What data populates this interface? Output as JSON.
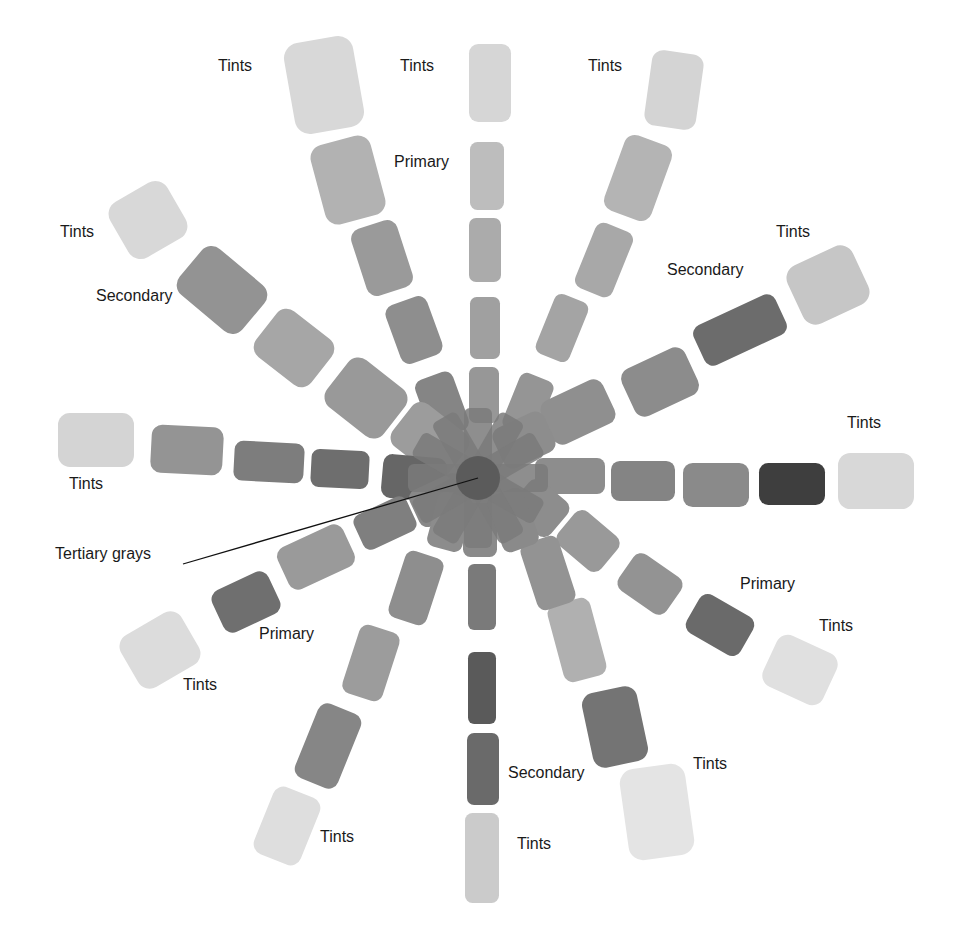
{
  "figure": {
    "center": [
      478,
      478
    ],
    "pointer": {
      "label": "Tertiary grays",
      "from": [
        183,
        564
      ],
      "to": [
        478,
        478
      ]
    },
    "labels": [
      {
        "text": "Tints",
        "x": 218,
        "y": 66
      },
      {
        "text": "Tints",
        "x": 400,
        "y": 66
      },
      {
        "text": "Tints",
        "x": 588,
        "y": 66
      },
      {
        "text": "Primary",
        "x": 394,
        "y": 162
      },
      {
        "text": "Tints",
        "x": 60,
        "y": 232
      },
      {
        "text": "Secondary",
        "x": 96,
        "y": 296
      },
      {
        "text": "Tints",
        "x": 776,
        "y": 232
      },
      {
        "text": "Secondary",
        "x": 667,
        "y": 270
      },
      {
        "text": "Tints",
        "x": 847,
        "y": 423
      },
      {
        "text": "Tints",
        "x": 69,
        "y": 484
      },
      {
        "text": "Tertiary grays",
        "x": 55,
        "y": 554
      },
      {
        "text": "Primary",
        "x": 740,
        "y": 584
      },
      {
        "text": "Tints",
        "x": 819,
        "y": 626
      },
      {
        "text": "Primary",
        "x": 259,
        "y": 634
      },
      {
        "text": "Tints",
        "x": 183,
        "y": 685
      },
      {
        "text": "Tints",
        "x": 693,
        "y": 764
      },
      {
        "text": "Secondary",
        "x": 508,
        "y": 773
      },
      {
        "text": "Tints",
        "x": 320,
        "y": 837
      },
      {
        "text": "Tints",
        "x": 517,
        "y": 844
      }
    ],
    "spokes": [
      {
        "name": "top-left-upper",
        "swatches": [
          {
            "x": 324,
            "y": 85,
            "w": 70,
            "h": 92,
            "a": -10,
            "c": "#d8d8d8"
          },
          {
            "x": 348,
            "y": 180,
            "w": 62,
            "h": 82,
            "a": -15,
            "c": "#b2b2b2"
          },
          {
            "x": 382,
            "y": 258,
            "w": 48,
            "h": 70,
            "a": -18,
            "c": "#9a9a9a"
          },
          {
            "x": 414,
            "y": 330,
            "w": 44,
            "h": 62,
            "a": -20,
            "c": "#8e8e8e"
          },
          {
            "x": 442,
            "y": 405,
            "w": 40,
            "h": 62,
            "a": -20,
            "c": "#858585"
          }
        ]
      },
      {
        "name": "top",
        "swatches": [
          {
            "x": 490,
            "y": 83,
            "w": 42,
            "h": 78,
            "a": 0,
            "c": "#d6d6d6"
          },
          {
            "x": 487,
            "y": 176,
            "w": 34,
            "h": 68,
            "a": 0,
            "c": "#bdbdbd"
          },
          {
            "x": 485,
            "y": 250,
            "w": 32,
            "h": 64,
            "a": 0,
            "c": "#ababab"
          },
          {
            "x": 485,
            "y": 328,
            "w": 30,
            "h": 62,
            "a": 0,
            "c": "#a0a0a0"
          },
          {
            "x": 484,
            "y": 395,
            "w": 30,
            "h": 56,
            "a": 0,
            "c": "#979797"
          }
        ]
      },
      {
        "name": "top-right-upper",
        "swatches": [
          {
            "x": 674,
            "y": 90,
            "w": 52,
            "h": 76,
            "a": 8,
            "c": "#d4d4d4"
          },
          {
            "x": 638,
            "y": 178,
            "w": 50,
            "h": 80,
            "a": 20,
            "c": "#b4b4b4"
          },
          {
            "x": 604,
            "y": 260,
            "w": 40,
            "h": 70,
            "a": 22,
            "c": "#a8a8a8"
          },
          {
            "x": 562,
            "y": 328,
            "w": 36,
            "h": 64,
            "a": 22,
            "c": "#a4a4a4"
          },
          {
            "x": 528,
            "y": 405,
            "w": 36,
            "h": 60,
            "a": 22,
            "c": "#959595"
          }
        ]
      },
      {
        "name": "upper-left",
        "swatches": [
          {
            "x": 148,
            "y": 220,
            "w": 66,
            "h": 64,
            "a": -30,
            "c": "#d8d8d8"
          },
          {
            "x": 222,
            "y": 290,
            "w": 82,
            "h": 60,
            "a": 40,
            "c": "#939393"
          },
          {
            "x": 294,
            "y": 348,
            "w": 70,
            "h": 58,
            "a": 38,
            "c": "#a6a6a6"
          },
          {
            "x": 366,
            "y": 398,
            "w": 72,
            "h": 60,
            "a": 38,
            "c": "#999999"
          },
          {
            "x": 430,
            "y": 440,
            "w": 70,
            "h": 54,
            "a": 38,
            "c": "#9c9c9c"
          }
        ]
      },
      {
        "name": "upper-right",
        "swatches": [
          {
            "x": 828,
            "y": 285,
            "w": 72,
            "h": 64,
            "a": -25,
            "c": "#c6c6c6"
          },
          {
            "x": 740,
            "y": 330,
            "w": 90,
            "h": 44,
            "a": -25,
            "c": "#6c6c6c"
          },
          {
            "x": 660,
            "y": 382,
            "w": 70,
            "h": 52,
            "a": -25,
            "c": "#8c8c8c"
          },
          {
            "x": 578,
            "y": 412,
            "w": 68,
            "h": 48,
            "a": -25,
            "c": "#8f8f8f"
          },
          {
            "x": 524,
            "y": 440,
            "w": 56,
            "h": 44,
            "a": -25,
            "c": "#8d8d8d"
          }
        ]
      },
      {
        "name": "left",
        "swatches": [
          {
            "x": 96,
            "y": 440,
            "w": 76,
            "h": 54,
            "a": 0,
            "c": "#d4d4d4"
          },
          {
            "x": 187,
            "y": 450,
            "w": 72,
            "h": 48,
            "a": 3,
            "c": "#949494"
          },
          {
            "x": 269,
            "y": 462,
            "w": 70,
            "h": 40,
            "a": 3,
            "c": "#7d7d7d"
          },
          {
            "x": 340,
            "y": 469,
            "w": 58,
            "h": 38,
            "a": 3,
            "c": "#6e6e6e"
          },
          {
            "x": 414,
            "y": 478,
            "w": 64,
            "h": 44,
            "a": 5,
            "c": "#666666"
          }
        ]
      },
      {
        "name": "right",
        "swatches": [
          {
            "x": 876,
            "y": 481,
            "w": 76,
            "h": 56,
            "a": 0,
            "c": "#d8d8d8"
          },
          {
            "x": 792,
            "y": 484,
            "w": 66,
            "h": 42,
            "a": 0,
            "c": "#3e3e3e"
          },
          {
            "x": 716,
            "y": 485,
            "w": 66,
            "h": 44,
            "a": 0,
            "c": "#8a8a8a"
          },
          {
            "x": 643,
            "y": 481,
            "w": 64,
            "h": 40,
            "a": 0,
            "c": "#848484"
          },
          {
            "x": 570,
            "y": 476,
            "w": 70,
            "h": 36,
            "a": 0,
            "c": "#8d8d8d"
          }
        ]
      },
      {
        "name": "lower-left",
        "swatches": [
          {
            "x": 160,
            "y": 650,
            "w": 70,
            "h": 60,
            "a": -30,
            "c": "#dcdcdc"
          },
          {
            "x": 246,
            "y": 602,
            "w": 62,
            "h": 46,
            "a": -25,
            "c": "#6f6f6f"
          },
          {
            "x": 316,
            "y": 557,
            "w": 72,
            "h": 46,
            "a": -25,
            "c": "#9a9a9a"
          },
          {
            "x": 385,
            "y": 523,
            "w": 58,
            "h": 38,
            "a": -25,
            "c": "#7f7f7f"
          },
          {
            "x": 440,
            "y": 500,
            "w": 56,
            "h": 40,
            "a": -25,
            "c": "#888888"
          }
        ]
      },
      {
        "name": "lower-right",
        "swatches": [
          {
            "x": 800,
            "y": 670,
            "w": 66,
            "h": 56,
            "a": 25,
            "c": "#e0e0e0"
          },
          {
            "x": 720,
            "y": 625,
            "w": 62,
            "h": 44,
            "a": 30,
            "c": "#6a6a6a"
          },
          {
            "x": 650,
            "y": 584,
            "w": 58,
            "h": 44,
            "a": 35,
            "c": "#939393"
          },
          {
            "x": 588,
            "y": 541,
            "w": 56,
            "h": 44,
            "a": 40,
            "c": "#999999"
          },
          {
            "x": 540,
            "y": 508,
            "w": 50,
            "h": 44,
            "a": 40,
            "c": "#8d8d8d"
          }
        ]
      },
      {
        "name": "bottom-left",
        "swatches": [
          {
            "x": 287,
            "y": 826,
            "w": 50,
            "h": 72,
            "a": 22,
            "c": "#dedede"
          },
          {
            "x": 328,
            "y": 746,
            "w": 46,
            "h": 80,
            "a": 22,
            "c": "#868686"
          },
          {
            "x": 371,
            "y": 663,
            "w": 42,
            "h": 72,
            "a": 18,
            "c": "#9c9c9c"
          },
          {
            "x": 416,
            "y": 588,
            "w": 40,
            "h": 70,
            "a": 18,
            "c": "#8e8e8e"
          },
          {
            "x": 450,
            "y": 522,
            "w": 36,
            "h": 56,
            "a": 15,
            "c": "#8c8c8c"
          }
        ]
      },
      {
        "name": "bottom",
        "swatches": [
          {
            "x": 482,
            "y": 858,
            "w": 34,
            "h": 90,
            "a": 0,
            "c": "#cbcbcb"
          },
          {
            "x": 483,
            "y": 769,
            "w": 32,
            "h": 72,
            "a": 0,
            "c": "#6a6a6a"
          },
          {
            "x": 482,
            "y": 688,
            "w": 28,
            "h": 72,
            "a": 0,
            "c": "#5a5a5a"
          },
          {
            "x": 482,
            "y": 597,
            "w": 28,
            "h": 66,
            "a": 0,
            "c": "#7a7a7a"
          },
          {
            "x": 480,
            "y": 530,
            "w": 34,
            "h": 54,
            "a": 0,
            "c": "#8a8a8a"
          }
        ]
      },
      {
        "name": "bottom-right",
        "swatches": [
          {
            "x": 657,
            "y": 812,
            "w": 66,
            "h": 92,
            "a": -8,
            "c": "#e4e4e4"
          },
          {
            "x": 615,
            "y": 727,
            "w": 56,
            "h": 76,
            "a": -12,
            "c": "#747474"
          },
          {
            "x": 577,
            "y": 640,
            "w": 44,
            "h": 80,
            "a": -15,
            "c": "#b0b0b0"
          },
          {
            "x": 548,
            "y": 573,
            "w": 40,
            "h": 70,
            "a": -18,
            "c": "#939393"
          },
          {
            "x": 513,
            "y": 520,
            "w": 38,
            "h": 60,
            "a": -20,
            "c": "#8a8a8a"
          }
        ]
      }
    ],
    "hub": {
      "x": 478,
      "y": 478,
      "r": 40,
      "c": "#7a7a7a",
      "core": "#4e4e4e"
    }
  }
}
